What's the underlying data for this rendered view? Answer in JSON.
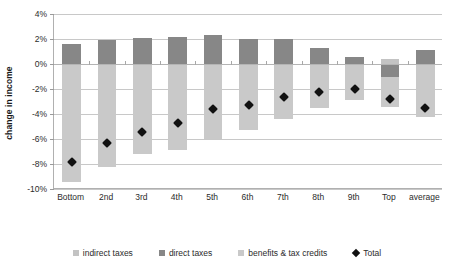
{
  "chart_data": {
    "type": "bar",
    "title": "",
    "subtitle": "",
    "xlabel": "income decile",
    "ylabel": "change in income",
    "ylim": [
      -10,
      4
    ],
    "yticks": [
      4,
      2,
      0,
      -2,
      -4,
      -6,
      -8,
      -10
    ],
    "ytick_labels": [
      "4%",
      "2%",
      "0%",
      "-2%",
      "-4%",
      "-6%",
      "-8%",
      "-10%"
    ],
    "grid": true,
    "stacked": true,
    "legend_position": "bottom",
    "categories": [
      "Bottom",
      "2nd",
      "3rd",
      "4th",
      "5th",
      "6th",
      "7th",
      "8th",
      "9th",
      "Top",
      "average"
    ],
    "series": [
      {
        "name": "indirect taxes",
        "color": "#c3c3c3",
        "values": [
          0.0,
          0.0,
          0.0,
          0.0,
          0.0,
          0.0,
          0.0,
          0.0,
          0.0,
          0.4,
          0.0
        ]
      },
      {
        "name": "direct taxes",
        "color": "#878787",
        "values": [
          1.6,
          1.9,
          2.1,
          2.2,
          2.3,
          2.0,
          2.0,
          1.3,
          0.6,
          -1.0,
          1.1
        ]
      },
      {
        "name": "benefits & tax credits",
        "color": "#c9c9c9",
        "values": [
          -9.4,
          -8.2,
          -7.2,
          -6.9,
          -6.0,
          -5.3,
          -4.4,
          -3.5,
          -2.9,
          -2.4,
          -4.2
        ]
      }
    ],
    "total_series": {
      "name": "Total",
      "marker": "diamond",
      "color": "#111111",
      "values": [
        -7.8,
        -6.3,
        -5.4,
        -4.7,
        -3.6,
        -3.3,
        -2.6,
        -2.2,
        -2.0,
        -2.8,
        -3.5
      ]
    }
  },
  "axis": {
    "y_title": "change in income",
    "x_title": "income decile"
  },
  "legend": {
    "items": [
      {
        "label": "indirect taxes",
        "marker": "square",
        "color": "#c3c3c3"
      },
      {
        "label": "direct taxes",
        "marker": "square",
        "color": "#878787"
      },
      {
        "label": "benefits & tax credits",
        "marker": "square",
        "color": "#c9c9c9"
      },
      {
        "label": "Total",
        "marker": "diamond",
        "color": "#111111"
      }
    ]
  }
}
